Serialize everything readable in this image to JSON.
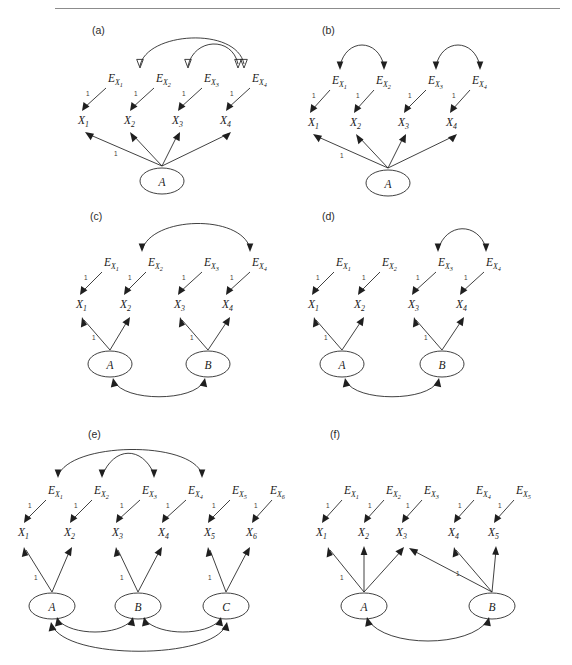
{
  "figure": {
    "panels": [
      {
        "id": "a",
        "label": "(a)",
        "errors": [
          "E",
          "E",
          "E",
          "E"
        ],
        "error_subs": [
          "X1",
          "X2",
          "X3",
          "X4"
        ],
        "indicators": [
          "X",
          "X",
          "X",
          "X"
        ],
        "indicator_subs": [
          "1",
          "2",
          "3",
          "4"
        ],
        "latents": [
          "A"
        ],
        "error_coefficients": [
          "1",
          "1",
          "1",
          "1"
        ],
        "latent_coefficients": [
          "1"
        ],
        "error_correlations": [
          [
            "EX2",
            "EX4"
          ],
          [
            "EX3",
            "EX4"
          ]
        ],
        "latent_correlations": [],
        "loadings": {
          "A": [
            "X1",
            "X2",
            "X3",
            "X4"
          ]
        }
      },
      {
        "id": "b",
        "label": "(b)",
        "errors": [
          "E",
          "E",
          "E",
          "E"
        ],
        "error_subs": [
          "X1",
          "X2",
          "X3",
          "X4"
        ],
        "indicators": [
          "X",
          "X",
          "X",
          "X"
        ],
        "indicator_subs": [
          "1",
          "2",
          "3",
          "4"
        ],
        "latents": [
          "A"
        ],
        "error_coefficients": [
          "1",
          "1",
          "1",
          "1"
        ],
        "latent_coefficients": [
          "1"
        ],
        "error_correlations": [
          [
            "EX1",
            "EX2"
          ],
          [
            "EX3",
            "EX4"
          ]
        ],
        "latent_correlations": [],
        "loadings": {
          "A": [
            "X1",
            "X2",
            "X3",
            "X4"
          ]
        }
      },
      {
        "id": "c",
        "label": "(c)",
        "errors": [
          "E",
          "E",
          "E",
          "E"
        ],
        "error_subs": [
          "X1",
          "X2",
          "X3",
          "X4"
        ],
        "indicators": [
          "X",
          "X",
          "X",
          "X"
        ],
        "indicator_subs": [
          "1",
          "2",
          "3",
          "4"
        ],
        "latents": [
          "A",
          "B"
        ],
        "error_coefficients": [
          "1",
          "1",
          "1",
          "1"
        ],
        "latent_coefficients": [
          "1",
          "1"
        ],
        "error_correlations": [
          [
            "EX2",
            "EX4"
          ]
        ],
        "latent_correlations": [
          [
            "A",
            "B"
          ]
        ],
        "loadings": {
          "A": [
            "X1",
            "X2"
          ],
          "B": [
            "X3",
            "X4"
          ]
        }
      },
      {
        "id": "d",
        "label": "(d)",
        "errors": [
          "E",
          "E",
          "E",
          "E"
        ],
        "error_subs": [
          "X1",
          "X2",
          "X3",
          "X4"
        ],
        "indicators": [
          "X",
          "X",
          "X",
          "X"
        ],
        "indicator_subs": [
          "1",
          "2",
          "3",
          "4"
        ],
        "latents": [
          "A",
          "B"
        ],
        "error_coefficients": [
          "1",
          "1",
          "1",
          "1"
        ],
        "latent_coefficients": [
          "1",
          "1"
        ],
        "error_correlations": [
          [
            "EX3",
            "EX4"
          ]
        ],
        "latent_correlations": [
          [
            "A",
            "B"
          ]
        ],
        "loadings": {
          "A": [
            "X1",
            "X2"
          ],
          "B": [
            "X3",
            "X4"
          ]
        }
      },
      {
        "id": "e",
        "label": "(e)",
        "errors": [
          "E",
          "E",
          "E",
          "E",
          "E",
          "E"
        ],
        "error_subs": [
          "X1",
          "X2",
          "X3",
          "X4",
          "X5",
          "X6"
        ],
        "indicators": [
          "X",
          "X",
          "X",
          "X",
          "X",
          "X"
        ],
        "indicator_subs": [
          "1",
          "2",
          "3",
          "4",
          "5",
          "6"
        ],
        "latents": [
          "A",
          "B",
          "C"
        ],
        "error_coefficients": [
          "1",
          "1",
          "1",
          "1",
          "1",
          "1"
        ],
        "latent_coefficients": [
          "1",
          "1",
          "1"
        ],
        "error_correlations": [
          [
            "EX1",
            "EX4"
          ],
          [
            "EX2",
            "EX3"
          ]
        ],
        "latent_correlations": [
          [
            "A",
            "B"
          ],
          [
            "B",
            "C"
          ],
          [
            "A",
            "C"
          ]
        ],
        "loadings": {
          "A": [
            "X1",
            "X2"
          ],
          "B": [
            "X3",
            "X4"
          ],
          "C": [
            "X5",
            "X6"
          ]
        }
      },
      {
        "id": "f",
        "label": "(f)",
        "errors": [
          "E",
          "E",
          "E",
          "E",
          "E"
        ],
        "error_subs": [
          "X1",
          "X2",
          "X3",
          "X4",
          "X5"
        ],
        "indicators": [
          "X",
          "X",
          "X",
          "X",
          "X"
        ],
        "indicator_subs": [
          "1",
          "2",
          "3",
          "4",
          "5"
        ],
        "latents": [
          "A",
          "B"
        ],
        "error_coefficients": [
          "1",
          "1",
          "1",
          "1",
          "1"
        ],
        "latent_coefficients": [
          "1",
          "1"
        ],
        "error_correlations": [],
        "latent_correlations": [
          [
            "A",
            "B"
          ]
        ],
        "loadings": {
          "A": [
            "X1",
            "X2",
            "X3"
          ],
          "B": [
            "X3",
            "X4",
            "X5"
          ]
        }
      }
    ],
    "symbols": {
      "error_prefix": "E",
      "indicator_prefix": "X",
      "unit_loading": "1"
    },
    "colors": {
      "line": "#1f1f1f",
      "text": "#1a1a1a",
      "rule": "#8c8c8c",
      "background": "#ffffff"
    }
  }
}
